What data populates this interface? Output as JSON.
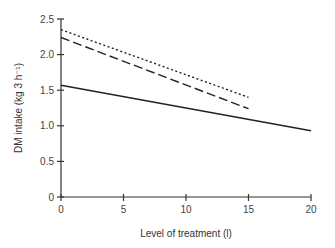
{
  "chart_data": {
    "type": "line",
    "title": "",
    "xlabel": "Level of treatment (l)",
    "ylabel": "DM intake (kg 3 h⁻¹)",
    "xlim": [
      0,
      20
    ],
    "ylim": [
      0,
      2.5
    ],
    "x_ticks": [
      "0",
      "5",
      "10",
      "15",
      "20"
    ],
    "y_ticks": [
      "0",
      "0.5",
      "1.0",
      "1.5",
      "2.0",
      "2.5"
    ],
    "grid": false,
    "legend": null,
    "series": [
      {
        "name": "dotted line",
        "style": "dotted",
        "x": [
          0,
          15
        ],
        "y": [
          2.35,
          1.4
        ]
      },
      {
        "name": "dashed line",
        "style": "dashed",
        "x": [
          0,
          15
        ],
        "y": [
          2.24,
          1.24
        ]
      },
      {
        "name": "solid line",
        "style": "solid",
        "x": [
          0,
          20
        ],
        "y": [
          1.57,
          0.93
        ]
      }
    ]
  }
}
